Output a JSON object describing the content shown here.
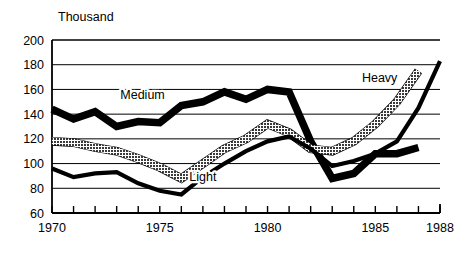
{
  "chart_data": {
    "type": "line",
    "title": "",
    "unit_label": "Thousand",
    "xlabel": "",
    "ylabel": "",
    "xlim": [
      1970,
      1988
    ],
    "ylim": [
      60,
      200
    ],
    "ytick_values": [
      60,
      80,
      100,
      120,
      140,
      160,
      180,
      200
    ],
    "ytick_labels": [
      "60",
      "80",
      "100",
      "120",
      "140",
      "160",
      "180",
      "200"
    ],
    "xtick_values": [
      1970,
      1971,
      1972,
      1973,
      1974,
      1975,
      1976,
      1977,
      1978,
      1979,
      1980,
      1981,
      1982,
      1983,
      1984,
      1985,
      1986,
      1987,
      1988
    ],
    "xtick_labels_shown": [
      "1970",
      "1975",
      "1980",
      "1985",
      "1988"
    ],
    "xtick_labels_shown_values": [
      1970,
      1975,
      1980,
      1985,
      1988
    ],
    "grid": true,
    "grid_axis": "y",
    "legend_position": "inline-annotations",
    "x": [
      1970,
      1971,
      1972,
      1973,
      1974,
      1975,
      1976,
      1977,
      1978,
      1979,
      1980,
      1981,
      1982,
      1983,
      1984,
      1985,
      1986,
      1987,
      1988
    ],
    "series": [
      {
        "name": "Medium",
        "style": "thick-black",
        "color": "#000000",
        "label_text": "Medium",
        "values": [
          144,
          136,
          142,
          130,
          134,
          133,
          147,
          150,
          158,
          152,
          160,
          158,
          118,
          88,
          92,
          108,
          108,
          113,
          null
        ]
      },
      {
        "name": "Heavy",
        "style": "gray-hatched",
        "color": "#7a7a7a",
        "label_text": "Heavy",
        "values": [
          118,
          117,
          113,
          110,
          104,
          97,
          88,
          100,
          112,
          120,
          132,
          125,
          112,
          110,
          118,
          132,
          150,
          175,
          null
        ]
      },
      {
        "name": "Light",
        "style": "thin-black",
        "color": "#000000",
        "label_text": "Light",
        "values": [
          96,
          89,
          92,
          93,
          84,
          78,
          75,
          89,
          100,
          110,
          118,
          122,
          112,
          98,
          102,
          108,
          118,
          145,
          183
        ]
      }
    ],
    "annotations": [
      {
        "text": "Medium",
        "x_value": 1974.2,
        "y_value": 152
      },
      {
        "text": "Heavy",
        "x_value": 1985.2,
        "y_value": 166
      },
      {
        "text": "Light",
        "x_value": 1977.0,
        "y_value": 86
      }
    ]
  }
}
